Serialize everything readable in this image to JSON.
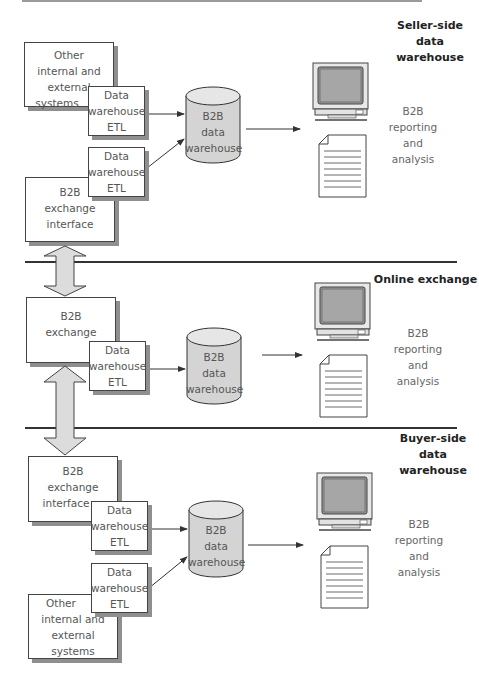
{
  "sections": [
    {
      "title": "Seller-side data warehouse",
      "title_lines": [
        "Seller-side",
        "data",
        "warehouse"
      ],
      "source_boxes": [
        {
          "lines": [
            "Other",
            "internal and",
            "external",
            "systems"
          ]
        },
        {
          "lines": [
            "B2B",
            "exchange",
            "interface"
          ]
        }
      ],
      "etl_boxes": [
        {
          "lines": [
            "Data",
            "warehouse",
            "ETL"
          ]
        },
        {
          "lines": [
            "Data",
            "warehouse",
            "ETL"
          ]
        }
      ],
      "warehouse": {
        "lines": [
          "B2B",
          "data",
          "warehouse"
        ]
      },
      "output": {
        "lines": [
          "B2B",
          "reporting",
          "and",
          "analysis"
        ]
      }
    },
    {
      "title": "Online exchange",
      "title_lines": [
        "Online exchange"
      ],
      "source_boxes": [
        {
          "lines": [
            "B2B",
            "exchange"
          ]
        }
      ],
      "etl_boxes": [
        {
          "lines": [
            "Data",
            "warehouse",
            "ETL"
          ]
        }
      ],
      "warehouse": {
        "lines": [
          "B2B",
          "data",
          "warehouse"
        ]
      },
      "output": {
        "lines": [
          "B2B",
          "reporting",
          "and",
          "analysis"
        ]
      }
    },
    {
      "title": "Buyer-side data warehouse",
      "title_lines": [
        "Buyer-side",
        "data",
        "warehouse"
      ],
      "source_boxes": [
        {
          "lines": [
            "B2B",
            "exchange",
            "interface"
          ]
        },
        {
          "lines": [
            "Other",
            "internal and",
            "external",
            "systems"
          ]
        }
      ],
      "etl_boxes": [
        {
          "lines": [
            "Data",
            "warehouse",
            "ETL"
          ]
        },
        {
          "lines": [
            "Data",
            "warehouse",
            "ETL"
          ]
        }
      ],
      "warehouse": {
        "lines": [
          "B2B",
          "data",
          "warehouse"
        ]
      },
      "output": {
        "lines": [
          "B2B",
          "reporting",
          "and",
          "analysis"
        ]
      }
    }
  ],
  "icons": {
    "monitor": "computer-monitor-icon",
    "document": "report-document-icon",
    "database": "database-cylinder-icon",
    "double_arrow": "bidirectional-arrow-icon"
  },
  "colors": {
    "line": "#333333",
    "shadow": "#8f8f8f",
    "cylinder_fill": "#d4d4d4",
    "arrow_fill": "#dcdcdc",
    "screen_fill": "#9c9c9c"
  }
}
